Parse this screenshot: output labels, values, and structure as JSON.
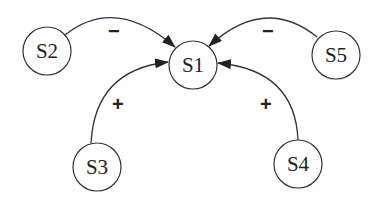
{
  "diagram": {
    "type": "signed-influence-graph",
    "nodes": [
      {
        "id": "S1",
        "label": "S1",
        "cx": 193,
        "cy": 65,
        "r": 24
      },
      {
        "id": "S2",
        "label": "S2",
        "cx": 47,
        "cy": 51,
        "r": 24
      },
      {
        "id": "S3",
        "label": "S3",
        "cx": 97,
        "cy": 167,
        "r": 24
      },
      {
        "id": "S4",
        "label": "S4",
        "cx": 298,
        "cy": 164,
        "r": 24
      },
      {
        "id": "S5",
        "label": "S5",
        "cx": 336,
        "cy": 55,
        "r": 24
      }
    ],
    "edges": [
      {
        "from": "S2",
        "to": "S1",
        "sign": "−",
        "polarity": "negative"
      },
      {
        "from": "S5",
        "to": "S1",
        "sign": "−",
        "polarity": "negative"
      },
      {
        "from": "S3",
        "to": "S1",
        "sign": "+",
        "polarity": "positive"
      },
      {
        "from": "S4",
        "to": "S1",
        "sign": "+",
        "polarity": "positive"
      }
    ],
    "colors": {
      "stroke": "#333333",
      "text": "#222222",
      "background": "#ffffff"
    }
  }
}
